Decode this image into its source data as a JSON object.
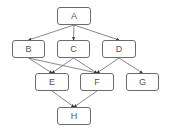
{
  "diagram": {
    "type": "directed-graph",
    "colors": {
      "stroke": "#6b6b6b",
      "text": "#555555",
      "fill": "#ffffff"
    },
    "nodes": [
      {
        "id": "A",
        "label": "A",
        "x": 57,
        "y": 7,
        "w": 34,
        "h": 18
      },
      {
        "id": "B",
        "label": "B",
        "x": 12,
        "y": 40,
        "w": 33,
        "h": 18
      },
      {
        "id": "C",
        "label": "C",
        "x": 57,
        "y": 40,
        "w": 33,
        "h": 18
      },
      {
        "id": "D",
        "label": "D",
        "x": 102,
        "y": 40,
        "w": 34,
        "h": 18
      },
      {
        "id": "E",
        "label": "E",
        "x": 35,
        "y": 73,
        "w": 34,
        "h": 18
      },
      {
        "id": "F",
        "label": "F",
        "x": 80,
        "y": 73,
        "w": 34,
        "h": 18
      },
      {
        "id": "G",
        "label": "G",
        "x": 126,
        "y": 73,
        "w": 33,
        "h": 18
      },
      {
        "id": "H",
        "label": "H",
        "x": 57,
        "y": 107,
        "w": 34,
        "h": 18
      }
    ],
    "edges": [
      {
        "from": "A",
        "to": "B"
      },
      {
        "from": "A",
        "to": "C"
      },
      {
        "from": "A",
        "to": "D"
      },
      {
        "from": "B",
        "to": "E"
      },
      {
        "from": "B",
        "to": "F"
      },
      {
        "from": "C",
        "to": "E"
      },
      {
        "from": "C",
        "to": "F"
      },
      {
        "from": "D",
        "to": "F"
      },
      {
        "from": "D",
        "to": "G"
      },
      {
        "from": "E",
        "to": "H"
      },
      {
        "from": "F",
        "to": "H"
      }
    ]
  }
}
